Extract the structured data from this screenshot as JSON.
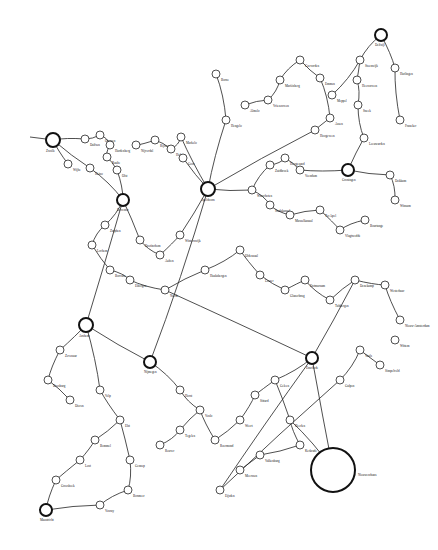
{
  "diagram": {
    "type": "network",
    "hubs": [
      {
        "id": "h1",
        "label": "Zwolle",
        "x": 53,
        "y": 140,
        "r": 7
      },
      {
        "id": "h2",
        "label": "Deventer",
        "x": 123,
        "y": 200,
        "r": 6
      },
      {
        "id": "h3",
        "label": "Apeldoorn",
        "x": 208,
        "y": 189,
        "r": 7
      },
      {
        "id": "h4",
        "label": "Groningen",
        "x": 348,
        "y": 170,
        "r": 6
      },
      {
        "id": "h5",
        "label": "Delfzijl",
        "x": 381,
        "y": 35,
        "r": 6
      },
      {
        "id": "h6",
        "label": "Arnhem",
        "x": 86,
        "y": 325,
        "r": 7
      },
      {
        "id": "h7",
        "label": "Nijmegen",
        "x": 150,
        "y": 362,
        "r": 6
      },
      {
        "id": "h8",
        "label": "Enschede",
        "x": 312,
        "y": 358,
        "r": 6
      },
      {
        "id": "h9",
        "label": "Maastricht",
        "x": 46,
        "y": 510,
        "r": 6
      },
      {
        "id": "h10",
        "label": "Nieuweschans",
        "x": 333,
        "y": 470,
        "r": 22
      }
    ],
    "nodes": [
      {
        "label": "Dalfsen",
        "x": 85,
        "y": 139
      },
      {
        "label": "Ommen",
        "x": 100,
        "y": 135
      },
      {
        "label": "Hardenberg",
        "x": 110,
        "y": 145
      },
      {
        "label": "Raalte",
        "x": 107,
        "y": 157
      },
      {
        "label": "Olst",
        "x": 117,
        "y": 170
      },
      {
        "label": "Wijhe",
        "x": 68,
        "y": 164
      },
      {
        "label": "Heino",
        "x": 90,
        "y": 168
      },
      {
        "label": "Nijverdal",
        "x": 136,
        "y": 145
      },
      {
        "label": "Rijssen",
        "x": 155,
        "y": 140
      },
      {
        "label": "Holten",
        "x": 171,
        "y": 149
      },
      {
        "label": "Markelo",
        "x": 181,
        "y": 137
      },
      {
        "label": "Goor",
        "x": 183,
        "y": 158
      },
      {
        "label": "Borne",
        "x": 216,
        "y": 74
      },
      {
        "label": "Hengelo",
        "x": 226,
        "y": 120
      },
      {
        "label": "Almelo",
        "x": 245,
        "y": 105
      },
      {
        "label": "Vriezenveen",
        "x": 268,
        "y": 100
      },
      {
        "label": "Mariënberg",
        "x": 280,
        "y": 80
      },
      {
        "label": "Coevorden",
        "x": 300,
        "y": 60
      },
      {
        "label": "Emmen",
        "x": 320,
        "y": 78
      },
      {
        "label": "Assen",
        "x": 330,
        "y": 118
      },
      {
        "label": "Hoogeveen",
        "x": 315,
        "y": 130
      },
      {
        "label": "Meppel",
        "x": 332,
        "y": 95
      },
      {
        "label": "Steenwijk",
        "x": 360,
        "y": 60
      },
      {
        "label": "Heerenveen",
        "x": 357,
        "y": 80
      },
      {
        "label": "Sneek",
        "x": 358,
        "y": 105
      },
      {
        "label": "Leeuwarden",
        "x": 364,
        "y": 138
      },
      {
        "label": "Harlingen",
        "x": 395,
        "y": 68
      },
      {
        "label": "Franeker",
        "x": 400,
        "y": 120
      },
      {
        "label": "Dokkum",
        "x": 390,
        "y": 175
      },
      {
        "label": "Winsum",
        "x": 395,
        "y": 200
      },
      {
        "label": "Veendam",
        "x": 300,
        "y": 170
      },
      {
        "label": "Hoogezand",
        "x": 285,
        "y": 158
      },
      {
        "label": "Zuidbroek",
        "x": 270,
        "y": 165
      },
      {
        "label": "Winschoten",
        "x": 252,
        "y": 190
      },
      {
        "label": "Stadskanaal",
        "x": 270,
        "y": 205
      },
      {
        "label": "Musselkanaal",
        "x": 290,
        "y": 215
      },
      {
        "label": "Ter Apel",
        "x": 320,
        "y": 210
      },
      {
        "label": "Vlagtwedde",
        "x": 340,
        "y": 230
      },
      {
        "label": "Bourtange",
        "x": 365,
        "y": 220
      },
      {
        "label": "Winterswijk",
        "x": 180,
        "y": 235
      },
      {
        "label": "Aalten",
        "x": 160,
        "y": 255
      },
      {
        "label": "Doetinchem",
        "x": 140,
        "y": 240
      },
      {
        "label": "Zutphen",
        "x": 105,
        "y": 225
      },
      {
        "label": "Lochem",
        "x": 92,
        "y": 245
      },
      {
        "label": "Borculo",
        "x": 110,
        "y": 270
      },
      {
        "label": "Eibergen",
        "x": 130,
        "y": 280
      },
      {
        "label": "Neede",
        "x": 165,
        "y": 290
      },
      {
        "label": "Haaksbergen",
        "x": 205,
        "y": 270
      },
      {
        "label": "Oldenzaal",
        "x": 240,
        "y": 250
      },
      {
        "label": "Losser",
        "x": 260,
        "y": 275
      },
      {
        "label": "Glanerbrug",
        "x": 285,
        "y": 290
      },
      {
        "label": "Ootmarsum",
        "x": 305,
        "y": 280
      },
      {
        "label": "Tubbergen",
        "x": 330,
        "y": 300
      },
      {
        "label": "Denekamp",
        "x": 355,
        "y": 280
      },
      {
        "label": "Westerhaar",
        "x": 385,
        "y": 285
      },
      {
        "label": "Nieuw-Amsterdam",
        "x": 400,
        "y": 320
      },
      {
        "label": "Zevenaar",
        "x": 60,
        "y": 350
      },
      {
        "label": "Doesburg",
        "x": 48,
        "y": 380
      },
      {
        "label": "Dieren",
        "x": 70,
        "y": 400
      },
      {
        "label": "Velp",
        "x": 100,
        "y": 390
      },
      {
        "label": "Elst",
        "x": 120,
        "y": 420
      },
      {
        "label": "Bemmel",
        "x": 95,
        "y": 440
      },
      {
        "label": "Lent",
        "x": 80,
        "y": 460
      },
      {
        "label": "Groesbeek",
        "x": 56,
        "y": 480
      },
      {
        "label": "Gennep",
        "x": 130,
        "y": 460
      },
      {
        "label": "Boxmeer",
        "x": 128,
        "y": 490
      },
      {
        "label": "Venray",
        "x": 100,
        "y": 505
      },
      {
        "label": "Horst",
        "x": 180,
        "y": 390
      },
      {
        "label": "Venlo",
        "x": 200,
        "y": 410
      },
      {
        "label": "Tegelen",
        "x": 180,
        "y": 430
      },
      {
        "label": "Reuver",
        "x": 160,
        "y": 445
      },
      {
        "label": "Roermond",
        "x": 215,
        "y": 440
      },
      {
        "label": "Weert",
        "x": 240,
        "y": 420
      },
      {
        "label": "Sittard",
        "x": 255,
        "y": 395
      },
      {
        "label": "Geleen",
        "x": 275,
        "y": 380
      },
      {
        "label": "Heerlen",
        "x": 290,
        "y": 420
      },
      {
        "label": "Kerkrade",
        "x": 300,
        "y": 445
      },
      {
        "label": "Valkenburg",
        "x": 260,
        "y": 455
      },
      {
        "label": "Meerssen",
        "x": 240,
        "y": 470
      },
      {
        "label": "Eijsden",
        "x": 220,
        "y": 490
      },
      {
        "label": "Gulpen",
        "x": 340,
        "y": 380
      },
      {
        "label": "Vaals",
        "x": 360,
        "y": 350
      },
      {
        "label": "Simpelveld",
        "x": 380,
        "y": 365
      },
      {
        "label": "Wittem",
        "x": 395,
        "y": 340
      }
    ],
    "edges": [
      [
        "h1",
        0
      ],
      [
        0,
        1
      ],
      [
        1,
        2
      ],
      [
        2,
        3
      ],
      [
        3,
        4
      ],
      [
        4,
        "h2"
      ],
      [
        "h1",
        5
      ],
      [
        "h1",
        6
      ],
      [
        6,
        "h2"
      ],
      [
        7,
        8
      ],
      [
        8,
        9
      ],
      [
        9,
        10
      ],
      [
        10,
        "h3"
      ],
      [
        11,
        "h3"
      ],
      [
        12,
        13
      ],
      [
        13,
        "h3"
      ],
      [
        14,
        15
      ],
      [
        15,
        16
      ],
      [
        16,
        17
      ],
      [
        17,
        18
      ],
      [
        18,
        19
      ],
      [
        19,
        20
      ],
      [
        20,
        "h3"
      ],
      [
        21,
        22
      ],
      [
        22,
        "h5"
      ],
      [
        23,
        22
      ],
      [
        24,
        23
      ],
      [
        25,
        24
      ],
      [
        25,
        "h4"
      ],
      [
        26,
        "h5"
      ],
      [
        27,
        26
      ],
      [
        "h4",
        28
      ],
      [
        28,
        29
      ],
      [
        "h4",
        30
      ],
      [
        30,
        31
      ],
      [
        31,
        32
      ],
      [
        32,
        33
      ],
      [
        33,
        "h3"
      ],
      [
        33,
        34
      ],
      [
        34,
        35
      ],
      [
        35,
        36
      ],
      [
        36,
        37
      ],
      [
        37,
        38
      ],
      [
        "h3",
        39
      ],
      [
        39,
        40
      ],
      [
        40,
        41
      ],
      [
        41,
        "h2"
      ],
      [
        "h2",
        42
      ],
      [
        42,
        43
      ],
      [
        43,
        44
      ],
      [
        44,
        45
      ],
      [
        45,
        46
      ],
      [
        46,
        47
      ],
      [
        47,
        48
      ],
      [
        48,
        49
      ],
      [
        49,
        50
      ],
      [
        50,
        51
      ],
      [
        51,
        52
      ],
      [
        52,
        53
      ],
      [
        53,
        54
      ],
      [
        54,
        55
      ],
      [
        "h2",
        "h6"
      ],
      [
        "h6",
        56
      ],
      [
        56,
        57
      ],
      [
        57,
        58
      ],
      [
        "h6",
        59
      ],
      [
        59,
        60
      ],
      [
        60,
        61
      ],
      [
        61,
        62
      ],
      [
        62,
        63
      ],
      [
        60,
        64
      ],
      [
        64,
        65
      ],
      [
        65,
        66
      ],
      [
        "h6",
        "h7"
      ],
      [
        "h7",
        67
      ],
      [
        67,
        68
      ],
      [
        68,
        69
      ],
      [
        69,
        70
      ],
      [
        68,
        71
      ],
      [
        71,
        72
      ],
      [
        72,
        73
      ],
      [
        73,
        74
      ],
      [
        74,
        75
      ],
      [
        74,
        "h8"
      ],
      [
        75,
        76
      ],
      [
        76,
        77
      ],
      [
        77,
        78
      ],
      [
        "h8",
        79
      ],
      [
        79,
        80
      ],
      [
        80,
        81
      ],
      [
        81,
        82
      ],
      [
        "h8",
        "h10"
      ],
      [
        75,
        "h10"
      ],
      [
        "h9",
        63
      ],
      [
        "h9",
        66
      ],
      [
        "h7",
        "h3"
      ],
      [
        46,
        "h8"
      ],
      [
        53,
        "h8"
      ]
    ]
  }
}
